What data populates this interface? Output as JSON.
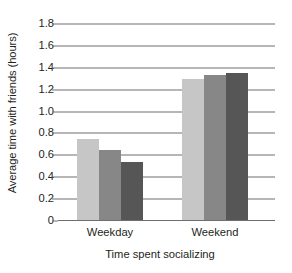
{
  "chart_data": {
    "type": "bar",
    "title": "",
    "subtitle": "",
    "xlabel": "Time spent socializing",
    "ylabel": "Average time with friends (hours)",
    "categories": [
      "Weekday",
      "Weekend"
    ],
    "series": [
      {
        "name": "Series 1",
        "values": [
          0.75,
          1.3
        ],
        "color": "#c6c6c6"
      },
      {
        "name": "Series 2",
        "values": [
          0.65,
          1.33
        ],
        "color": "#878787"
      },
      {
        "name": "Series 3",
        "values": [
          0.54,
          1.35
        ],
        "color": "#565656"
      }
    ],
    "ylim": [
      0,
      1.8
    ],
    "ytick_values": [
      0,
      0.2,
      0.4,
      0.6,
      0.8,
      1.0,
      1.2,
      1.4,
      1.6,
      1.8
    ],
    "ytick_labels": [
      "0",
      "0.2",
      "0.4",
      "0.6",
      "0.8",
      "1.0",
      "1.2",
      "1.4",
      "1.6",
      "1.8"
    ],
    "grid": true,
    "grid_color": "#6d6e71",
    "legend": "none",
    "background": "#ffffff",
    "text_color": "#231f20"
  }
}
